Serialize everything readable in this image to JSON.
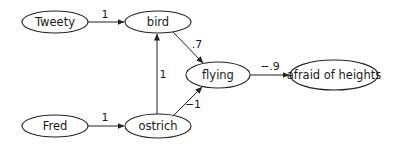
{
  "diagram": {
    "type": "directed-graph",
    "nodes": {
      "tweety": {
        "label": "Tweety",
        "cx": 55,
        "cy": 22,
        "rx": 33,
        "ry": 11
      },
      "bird": {
        "label": "bird",
        "cx": 158,
        "cy": 22,
        "rx": 33,
        "ry": 11
      },
      "flying": {
        "label": "flying",
        "cx": 218,
        "cy": 75,
        "rx": 32,
        "ry": 13
      },
      "afraid": {
        "label": "afraid of heights",
        "cx": 334,
        "cy": 75,
        "rx": 44,
        "ry": 15
      },
      "fred": {
        "label": "Fred",
        "cx": 55,
        "cy": 126,
        "rx": 33,
        "ry": 11
      },
      "ostrich": {
        "label": "ostrich",
        "cx": 158,
        "cy": 126,
        "rx": 33,
        "ry": 12
      }
    },
    "edges": {
      "tweety_bird": {
        "from": "Tweety",
        "to": "bird",
        "weight": "1"
      },
      "bird_flying": {
        "from": "bird",
        "to": "flying",
        "weight": ".7"
      },
      "ostrich_bird": {
        "from": "ostrich",
        "to": "bird",
        "weight": "1"
      },
      "ostrich_flying": {
        "from": "ostrich",
        "to": "flying",
        "weight": "−1"
      },
      "flying_afraid": {
        "from": "flying",
        "to": "afraid of heights",
        "weight": "−.9"
      },
      "fred_ostrich": {
        "from": "Fred",
        "to": "ostrich",
        "weight": "1"
      }
    }
  }
}
